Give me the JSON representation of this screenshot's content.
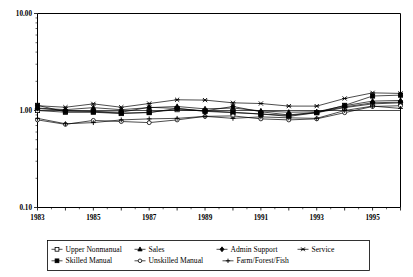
{
  "chart_data": {
    "type": "line",
    "title": "",
    "subtitle": "",
    "xlabel": "",
    "ylabel": "",
    "yscale": "log",
    "ylim": [
      0.1,
      10.0
    ],
    "ytick_labels": [
      "10.00",
      "1.00",
      "0.10"
    ],
    "ytick_values": [
      10.0,
      1.0,
      0.1
    ],
    "xlim": [
      1983,
      1996
    ],
    "xtick_labels": [
      "1983",
      "1985",
      "1987",
      "1989",
      "1991",
      "1993",
      "1995"
    ],
    "xtick_values": [
      1983,
      1985,
      1987,
      1989,
      1991,
      1993,
      1995
    ],
    "x": [
      1983,
      1984,
      1985,
      1986,
      1987,
      1988,
      1989,
      1990,
      1991,
      1992,
      1993,
      1994,
      1995,
      1996
    ],
    "grid": false,
    "reference_line": 1.0,
    "legend_position": "bottom",
    "series": [
      {
        "name": "Upper Nonmanual",
        "marker": "open-square",
        "values": [
          1.0,
          0.96,
          0.96,
          0.93,
          0.96,
          1.02,
          0.99,
          0.96,
          0.92,
          0.89,
          0.95,
          1.07,
          1.17,
          1.2
        ]
      },
      {
        "name": "Sales",
        "marker": "filled-triangle",
        "values": [
          1.06,
          1.02,
          1.07,
          1.02,
          1.07,
          1.1,
          1.04,
          1.06,
          0.99,
          0.96,
          0.97,
          1.12,
          1.25,
          1.27
        ]
      },
      {
        "name": "Admin Support",
        "marker": "filled-diamond",
        "values": [
          1.05,
          1.0,
          0.98,
          0.96,
          1.08,
          1.05,
          0.99,
          1.1,
          0.97,
          0.9,
          0.96,
          1.09,
          1.2,
          1.22
        ]
      },
      {
        "name": "Service",
        "marker": "cross-x",
        "values": [
          1.12,
          1.08,
          1.17,
          1.08,
          1.18,
          1.29,
          1.28,
          1.2,
          1.18,
          1.11,
          1.11,
          1.33,
          1.52,
          1.5
        ]
      },
      {
        "name": "Skilled Manual",
        "marker": "filled-square",
        "values": [
          1.13,
          0.97,
          0.97,
          0.94,
          0.95,
          1.05,
          0.98,
          0.95,
          0.92,
          0.87,
          0.95,
          1.13,
          1.41,
          1.44
        ]
      },
      {
        "name": "Unskilled Manual",
        "marker": "open-circle",
        "values": [
          0.8,
          0.72,
          0.79,
          0.77,
          0.75,
          0.8,
          0.87,
          0.88,
          0.82,
          0.8,
          0.82,
          0.95,
          1.1,
          1.12
        ]
      },
      {
        "name": "Farm/Forest/Fish",
        "marker": "plus",
        "values": [
          0.83,
          0.73,
          0.75,
          0.8,
          0.82,
          0.83,
          0.87,
          0.83,
          0.86,
          0.84,
          0.83,
          1.0,
          1.11,
          1.05
        ]
      }
    ],
    "legend_entries": [
      {
        "label": "Upper Nonmanual",
        "marker": "open-square"
      },
      {
        "label": "Sales",
        "marker": "filled-triangle"
      },
      {
        "label": "Admin Support",
        "marker": "filled-diamond"
      },
      {
        "label": "Service",
        "marker": "cross-x"
      },
      {
        "label": "Skilled Manual",
        "marker": "filled-square"
      },
      {
        "label": "Unskilled Manual",
        "marker": "open-circle"
      },
      {
        "label": "Farm/Forest/Fish",
        "marker": "plus"
      }
    ]
  }
}
